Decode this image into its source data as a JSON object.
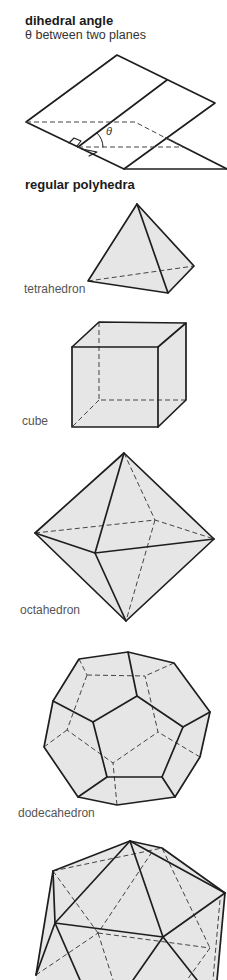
{
  "section_dihedral": {
    "title": "dihedral angle",
    "subtitle": "θ between two planes",
    "angle_symbol": "θ"
  },
  "section_polyhedra": {
    "title": "regular polyhedra",
    "shapes": [
      {
        "name": "tetrahedron"
      },
      {
        "name": "cube"
      },
      {
        "name": "octahedron"
      },
      {
        "name": "dodecahedron"
      },
      {
        "name": "icosahedron"
      }
    ]
  },
  "colors": {
    "line": "#1e1e1e",
    "face_fill": "#e6e6e6",
    "label_text": "#555555"
  }
}
